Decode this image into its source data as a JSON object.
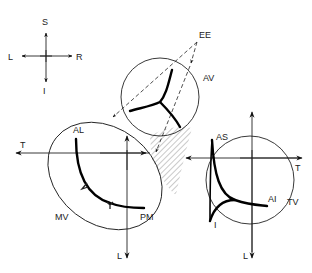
{
  "diagram": {
    "compass": {
      "superior": "S",
      "inferior": "I",
      "left": "L",
      "right": "R"
    },
    "valves": {
      "aortic": {
        "label": "AV"
      },
      "mitral": {
        "label": "MV",
        "commissures": [
          "AL",
          "PM"
        ]
      },
      "tricuspid": {
        "label": "TV",
        "commissures": [
          "AS",
          "AI",
          "I"
        ]
      }
    },
    "arrow_labels": {
      "ee": "EE",
      "mitral_t": "T",
      "mitral_l": "L",
      "tricuspid_t": "T",
      "tricuspid_l": "L"
    },
    "colors": {
      "line": "#222222",
      "background": "#ffffff"
    }
  }
}
